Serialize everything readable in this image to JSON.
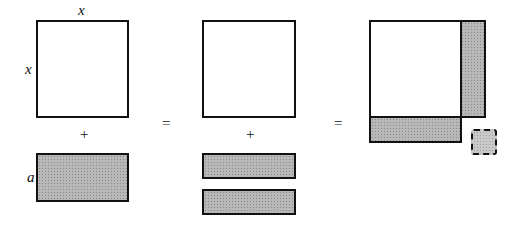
{
  "labels": {
    "top_x": "x",
    "side_x": "x",
    "side_a": "a"
  },
  "operators": {
    "plus_left": "+",
    "plus_middle": "+",
    "equals_1": "=",
    "equals_2": "="
  },
  "colors": {
    "stroke": "#111111",
    "shade": "#b8b8b8",
    "fill": "#ffffff"
  },
  "figures": [
    {
      "name": "x-squared-plus-ax",
      "parts": [
        "square x by x",
        "rectangle x by a"
      ]
    },
    {
      "name": "square-plus-two-half-rects",
      "parts": [
        "square x by x",
        "rectangle x by a/2",
        "rectangle x by a/2"
      ]
    },
    {
      "name": "completed-square",
      "parts": [
        "square x by x",
        "right strip a/2",
        "bottom strip a/2",
        "missing corner square (dashed)"
      ]
    }
  ]
}
